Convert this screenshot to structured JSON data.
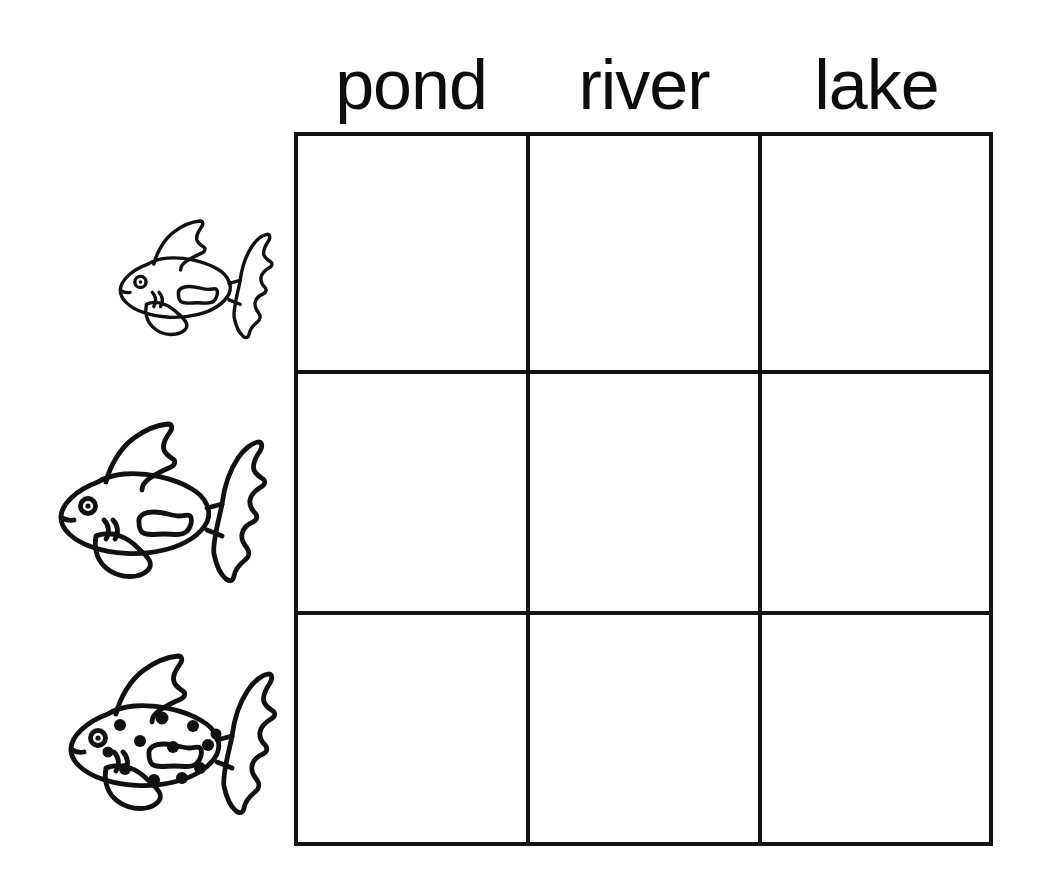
{
  "worksheet": {
    "title": "Fish habitat sorting grid",
    "background_color": "#ffffff",
    "ink_color": "#0d0d0d"
  },
  "columns": [
    {
      "id": "pond",
      "label": "pond"
    },
    {
      "id": "river",
      "label": "river"
    },
    {
      "id": "lake",
      "label": "lake"
    }
  ],
  "rows": [
    {
      "id": "small-plain-fish",
      "icon": "fish-icon",
      "description": "small plain outlined fish",
      "size": "small",
      "pattern": "plain",
      "spot_count": 0
    },
    {
      "id": "large-plain-fish",
      "icon": "fish-icon",
      "description": "large plain outlined fish",
      "size": "large",
      "pattern": "plain",
      "spot_count": 0
    },
    {
      "id": "large-spotted-fish",
      "icon": "spotted-fish-icon",
      "description": "large spotted outlined fish",
      "size": "large",
      "pattern": "spotted",
      "spot_count": 12
    }
  ],
  "grid": {
    "rows": 3,
    "columns": 3,
    "line_color": "#141414",
    "line_width": 4,
    "cells": [
      [
        {
          "value": ""
        },
        {
          "value": ""
        },
        {
          "value": ""
        }
      ],
      [
        {
          "value": ""
        },
        {
          "value": ""
        },
        {
          "value": ""
        }
      ],
      [
        {
          "value": ""
        },
        {
          "value": ""
        },
        {
          "value": ""
        }
      ]
    ]
  }
}
